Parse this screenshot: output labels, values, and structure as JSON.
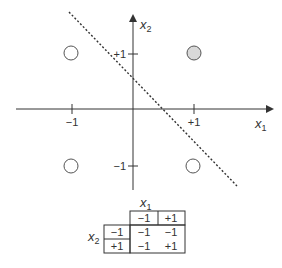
{
  "diagram": {
    "title": "",
    "axes": {
      "x_label": "x",
      "x_label_sub": "1",
      "y_label": "x",
      "y_label_sub": "2",
      "x_ticks": [
        {
          "value": -1,
          "label": "−1"
        },
        {
          "value": 1,
          "label": "+1"
        }
      ],
      "y_ticks": [
        {
          "value": 1,
          "label": "+1"
        },
        {
          "value": -1,
          "label": "−1"
        }
      ]
    },
    "points": [
      {
        "x1": -1,
        "x2": 1,
        "filled": false,
        "output": -1
      },
      {
        "x1": 1,
        "x2": 1,
        "filled": true,
        "output": 1
      },
      {
        "x1": -1,
        "x2": -1,
        "filled": false,
        "output": -1
      },
      {
        "x1": 1,
        "x2": -1,
        "filled": false,
        "output": -1
      }
    ],
    "decision_boundary": {
      "style": "dotted",
      "equation": "x1 + x2 = 0.5"
    },
    "colors": {
      "filled_point": "#d9d9d9",
      "stroke": "#333333",
      "table_header_bg": "#ffffff"
    }
  },
  "truth_table": {
    "col_var": "x",
    "col_var_sub": "1",
    "row_var": "x",
    "row_var_sub": "2",
    "col_headers": [
      "−1",
      "+1"
    ],
    "row_headers": [
      "−1",
      "+1"
    ],
    "cells": [
      [
        "−1",
        "−1"
      ],
      [
        "−1",
        "+1"
      ]
    ]
  }
}
